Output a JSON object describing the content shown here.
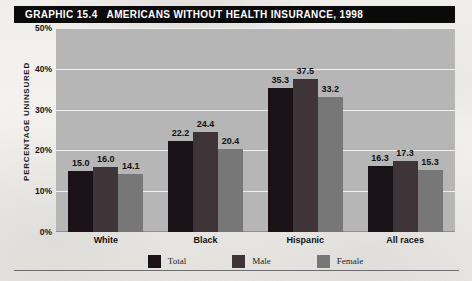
{
  "title": {
    "graphic_number": "GRAPHIC 15.4",
    "headline": "AMERICANS WITHOUT HEALTH INSURANCE, 1998"
  },
  "colors": {
    "title_band": "#0a0a0a",
    "title_text": "#ffffff",
    "plot_background": "#b6b6b6",
    "gridline": "#f0f0f0",
    "page_background": "#f2f1ee",
    "total": "#1a1216",
    "male": "#3f3438",
    "female": "#777777"
  },
  "chart_data": {
    "type": "bar",
    "title": "AMERICANS WITHOUT HEALTH INSURANCE, 1998",
    "xlabel": "",
    "ylabel": "PERCENTAGE UNINSURED",
    "ylim": [
      0,
      50
    ],
    "ytick_labels": [
      "0%",
      "10%",
      "20%",
      "30%",
      "40%",
      "50%"
    ],
    "ytick_values": [
      0,
      10,
      20,
      30,
      40,
      50
    ],
    "grid": true,
    "legend_position": "bottom",
    "categories": [
      "White",
      "Black",
      "Hispanic",
      "All races"
    ],
    "series": [
      {
        "name": "Total",
        "color": "#1a1216",
        "values": [
          15.0,
          16.0,
          35.3,
          16.3
        ]
      },
      {
        "name": "Male",
        "color": "#3f3438",
        "values": [
          16.0,
          24.4,
          37.5,
          17.3
        ]
      },
      {
        "name": "Female",
        "color": "#777777",
        "values": [
          14.1,
          20.4,
          33.2,
          15.3
        ]
      }
    ],
    "data_labels": {
      "White": {
        "Total": "15.0",
        "Male": "16.0",
        "Female": "14.1"
      },
      "Black": {
        "Total": "22.2",
        "Male": "24.4",
        "Female": "20.4"
      },
      "Hispanic": {
        "Total": "35.3",
        "Male": "37.5",
        "Female": "33.2"
      },
      "All races": {
        "Total": "16.3",
        "Male": "17.3",
        "Female": "15.3"
      }
    },
    "values_by_group": [
      {
        "category": "White",
        "total": 15.0,
        "male": 16.0,
        "female": 14.1
      },
      {
        "category": "Black",
        "total": 22.2,
        "male": 24.4,
        "female": 20.4
      },
      {
        "category": "Hispanic",
        "total": 35.3,
        "male": 37.5,
        "female": 33.2
      },
      {
        "category": "All races",
        "total": 16.3,
        "male": 17.3,
        "female": 15.3
      }
    ]
  }
}
